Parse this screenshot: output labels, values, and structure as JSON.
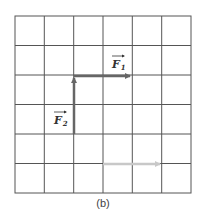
{
  "figure": {
    "caption": "(b)",
    "grid": {
      "rows": 6,
      "cols": 6,
      "x0": 15,
      "y0": 16,
      "cell": 29.3,
      "line_color": "#555555"
    },
    "vectors": [
      {
        "name": "F1",
        "label_main": "F",
        "label_sub": "1",
        "from": [
          2,
          2
        ],
        "to": [
          4,
          2
        ],
        "color": "#666666"
      },
      {
        "name": "F2",
        "label_main": "F",
        "label_sub": "2",
        "from": [
          2,
          4
        ],
        "to": [
          2,
          2
        ],
        "color": "#666666"
      },
      {
        "name": "resultant-hint",
        "label_main": "",
        "label_sub": "",
        "from": [
          3,
          5
        ],
        "to": [
          5,
          5
        ],
        "color": "#c8c8c8"
      }
    ]
  }
}
